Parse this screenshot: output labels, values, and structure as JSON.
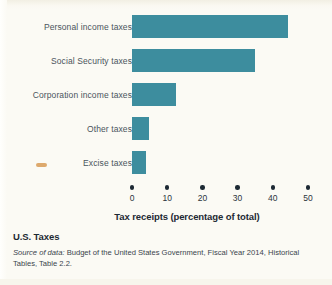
{
  "figure": {
    "caption_title": "U.S. Taxes",
    "source_lead": "Source of data:",
    "source_text": " Budget of the United States Government, Fiscal Year 2014, Historical Tables, Table 2.2."
  },
  "colors": {
    "bar": "#3d8d9e",
    "background": "#fbfaf4",
    "label_text": "#4a545c",
    "axis_text": "#1d2933",
    "smudge": "#d79a55"
  },
  "chart_data": {
    "type": "bar",
    "orientation": "horizontal",
    "title": "U.S. Taxes",
    "xlabel": "Tax receipts (percentage of total)",
    "ylabel": "",
    "xlim": [
      0,
      50
    ],
    "xticks": [
      0,
      10,
      20,
      30,
      40,
      50
    ],
    "xtick_labels": [
      "0",
      "10",
      "20",
      "30",
      "40",
      "50"
    ],
    "grid": false,
    "legend": false,
    "tick_style": "dot-markers",
    "categories": [
      "Personal income taxes",
      "Social Security taxes",
      "Corporation income taxes",
      "Other taxes",
      "Excise taxes"
    ],
    "values": [
      44.3,
      35.0,
      12.5,
      4.8,
      3.9
    ]
  }
}
